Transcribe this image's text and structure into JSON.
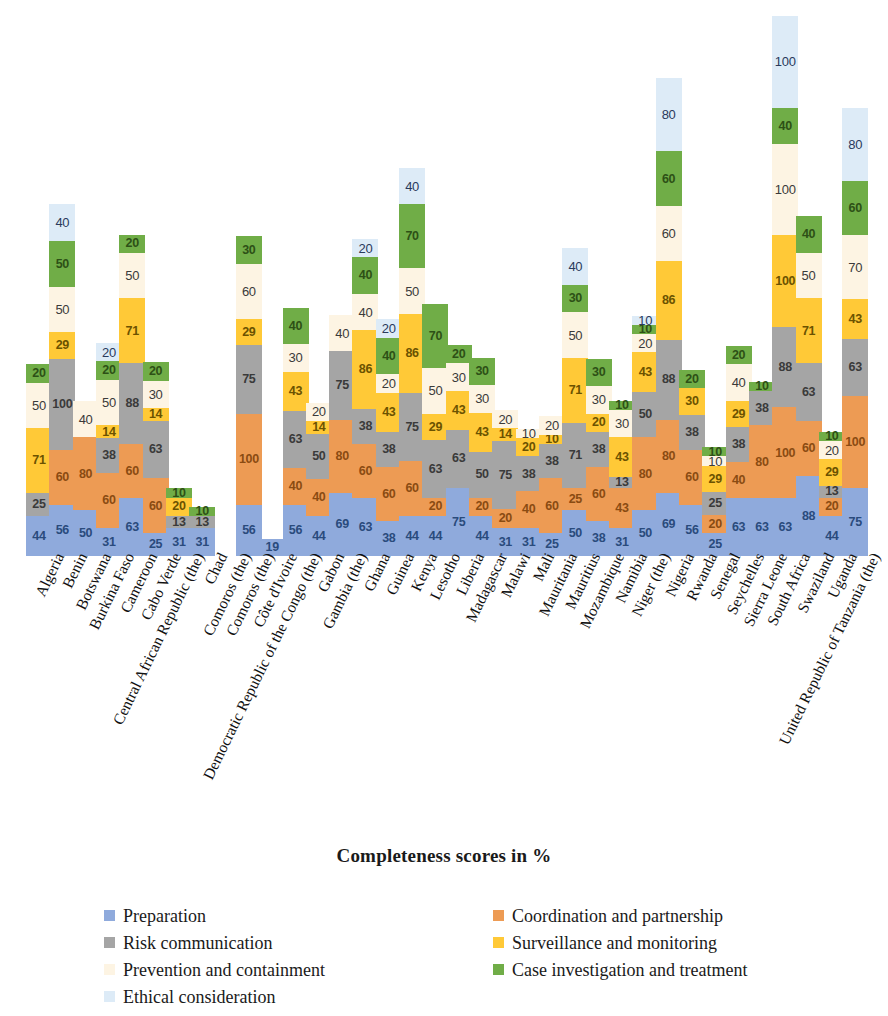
{
  "chart_data": {
    "type": "bar",
    "subtype": "stacked-column",
    "title": "",
    "xlabel": "Completeness scores in %",
    "ylabel": "",
    "grid": false,
    "legend_position": "bottom",
    "ylim": [
      0,
      600
    ],
    "series": [
      {
        "name": "Preparation",
        "color": "#8FAADC",
        "values": [
          44,
          56,
          50,
          31,
          63,
          25,
          31,
          31,
          0,
          56,
          19,
          56,
          44,
          69,
          63,
          38,
          44,
          44,
          75,
          44,
          31,
          31,
          25,
          50,
          38,
          31,
          50,
          69,
          56,
          25,
          63,
          63,
          63,
          88,
          44,
          75
        ]
      },
      {
        "name": "Coordination and partnership",
        "color": "#ED9B54",
        "values": [
          0,
          60,
          80,
          60,
          60,
          60,
          0,
          0,
          0,
          100,
          0,
          40,
          40,
          80,
          60,
          60,
          60,
          20,
          0,
          20,
          20,
          40,
          60,
          25,
          60,
          43,
          80,
          80,
          60,
          20,
          40,
          80,
          100,
          60,
          20,
          100
        ]
      },
      {
        "name": "Risk communication",
        "color": "#A5A5A5",
        "values": [
          25,
          100,
          0,
          38,
          88,
          63,
          13,
          13,
          0,
          75,
          0,
          63,
          50,
          75,
          38,
          38,
          75,
          63,
          63,
          50,
          75,
          38,
          38,
          71,
          38,
          13,
          50,
          88,
          38,
          25,
          38,
          38,
          88,
          63,
          13,
          63
        ]
      },
      {
        "name": "Surveillance and monitoring",
        "color": "#FFC937",
        "values": [
          71,
          29,
          0,
          14,
          71,
          14,
          20,
          0,
          0,
          29,
          0,
          43,
          14,
          0,
          86,
          43,
          86,
          29,
          43,
          43,
          14,
          20,
          10,
          71,
          20,
          43,
          43,
          86,
          30,
          29,
          29,
          0,
          100,
          71,
          29,
          43
        ]
      },
      {
        "name": "Prevention and containment",
        "color": "#FDF4E3",
        "values": [
          50,
          50,
          40,
          50,
          50,
          30,
          0,
          0,
          0,
          60,
          0,
          30,
          20,
          40,
          40,
          20,
          50,
          50,
          30,
          30,
          20,
          10,
          20,
          50,
          30,
          30,
          20,
          60,
          0,
          10,
          40,
          0,
          100,
          50,
          20,
          70
        ]
      },
      {
        "name": "Case investigation and treatment",
        "color": "#70AD47",
        "values": [
          20,
          50,
          0,
          20,
          20,
          20,
          10,
          10,
          0,
          30,
          0,
          40,
          0,
          0,
          40,
          40,
          70,
          70,
          20,
          30,
          0,
          0,
          0,
          30,
          30,
          10,
          10,
          60,
          20,
          10,
          20,
          10,
          40,
          40,
          10,
          60
        ]
      },
      {
        "name": "Ethical consideration",
        "color": "#DDEBF7",
        "values": [
          0,
          40,
          0,
          20,
          0,
          0,
          0,
          0,
          0,
          0,
          0,
          0,
          0,
          0,
          20,
          20,
          40,
          0,
          0,
          0,
          0,
          0,
          0,
          40,
          0,
          0,
          10,
          80,
          0,
          0,
          0,
          0,
          100,
          0,
          0,
          80
        ]
      }
    ],
    "categories": [
      "Algeria",
      "Benin",
      "Botswana",
      "Burkina Faso",
      "Cameroon",
      "Cabo Verde",
      "Central African Republic (the)",
      "Chad",
      "Comoros (the)",
      "Comoros (the)2",
      "Côte d'Ivoire",
      "Democratic Republic of the Congo (the)",
      "Gabon",
      "Gambia (the)",
      "Ghana",
      "Guinea",
      "Kenya",
      "Lesotho",
      "Liberia",
      "Madagascar",
      "Malawi",
      "Mali",
      "Mauritania",
      "Mauritius",
      "Mozambique",
      "Namibia",
      "Niger (the)",
      "Nigeria",
      "Rwanda",
      "Senegal",
      "Seychelles",
      "Sierra Leone",
      "South Africa",
      "Swaziland",
      "Uganda",
      "United Republic of Tanzania (the)"
    ]
  },
  "axis": {
    "x_title": "Completeness scores in %"
  },
  "legend": {
    "items": [
      {
        "label": "Preparation",
        "color": "#8FAADC",
        "icon": "legend-swatch"
      },
      {
        "label": "Risk communication",
        "color": "#A5A5A5",
        "icon": "legend-swatch"
      },
      {
        "label": "Prevention and containment",
        "color": "#FDF4E3",
        "icon": "legend-swatch"
      },
      {
        "label": "Ethical consideration",
        "color": "#DDEBF7",
        "icon": "legend-swatch"
      },
      {
        "label": "Coordination and partnership",
        "color": "#ED9B54",
        "icon": "legend-swatch"
      },
      {
        "label": "Surveillance and monitoring",
        "color": "#FFC937",
        "icon": "legend-swatch"
      },
      {
        "label": "Case investigation and treatment",
        "color": "#70AD47",
        "icon": "legend-swatch"
      }
    ]
  }
}
